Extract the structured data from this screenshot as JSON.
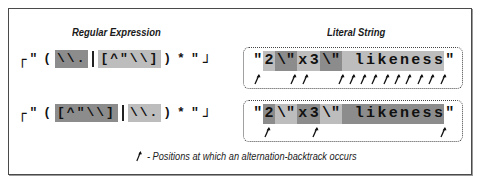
{
  "headings": {
    "regex": "Regular Expression",
    "literal": "Literal String"
  },
  "rows": [
    {
      "regex_tokens": [
        {
          "text": "\"",
          "shade": "none"
        },
        {
          "text": "(",
          "shade": "none"
        },
        {
          "text": "\\\\.",
          "shade": "dark"
        },
        {
          "text": "|",
          "shade": "sep"
        },
        {
          "text": "[^\"\\\\]",
          "shade": "light"
        },
        {
          "text": ")",
          "shade": "none"
        },
        {
          "text": "*",
          "shade": "none"
        },
        {
          "text": "\"",
          "shade": "none"
        }
      ],
      "literal_cells": [
        {
          "text": "\"",
          "shade": "none"
        },
        {
          "text": "2",
          "shade": "light"
        },
        {
          "text": "\\\"",
          "shade": "dark"
        },
        {
          "text": "x",
          "shade": "light"
        },
        {
          "text": "3",
          "shade": "light"
        },
        {
          "text": "\\\"",
          "shade": "dark"
        },
        {
          "text": " ",
          "shade": "light"
        },
        {
          "text": "l",
          "shade": "light"
        },
        {
          "text": "i",
          "shade": "light"
        },
        {
          "text": "k",
          "shade": "light"
        },
        {
          "text": "e",
          "shade": "light"
        },
        {
          "text": "n",
          "shade": "light"
        },
        {
          "text": "e",
          "shade": "light"
        },
        {
          "text": "s",
          "shade": "light"
        },
        {
          "text": "s",
          "shade": "light"
        },
        {
          "text": "\"",
          "shade": "none"
        }
      ],
      "arrow_positions": [
        258,
        294,
        306,
        342,
        353,
        364,
        375,
        387,
        398,
        409,
        421,
        432,
        444
      ]
    },
    {
      "regex_tokens": [
        {
          "text": "\"",
          "shade": "none"
        },
        {
          "text": "(",
          "shade": "none"
        },
        {
          "text": "[^\"\\\\]",
          "shade": "dark"
        },
        {
          "text": "|",
          "shade": "sep"
        },
        {
          "text": "\\\\.",
          "shade": "light"
        },
        {
          "text": ")",
          "shade": "none"
        },
        {
          "text": "*",
          "shade": "none"
        },
        {
          "text": "\"",
          "shade": "none"
        }
      ],
      "literal_cells": [
        {
          "text": "\"",
          "shade": "none"
        },
        {
          "text": "2",
          "shade": "dark"
        },
        {
          "text": "\\\"",
          "shade": "light"
        },
        {
          "text": "x",
          "shade": "dark"
        },
        {
          "text": "3",
          "shade": "dark"
        },
        {
          "text": "\\\"",
          "shade": "light"
        },
        {
          "text": " ",
          "shade": "dark"
        },
        {
          "text": "l",
          "shade": "dark"
        },
        {
          "text": "i",
          "shade": "dark"
        },
        {
          "text": "k",
          "shade": "dark"
        },
        {
          "text": "e",
          "shade": "dark"
        },
        {
          "text": "n",
          "shade": "dark"
        },
        {
          "text": "e",
          "shade": "dark"
        },
        {
          "text": "s",
          "shade": "dark"
        },
        {
          "text": "s",
          "shade": "dark"
        },
        {
          "text": "\"",
          "shade": "none"
        }
      ],
      "arrow_positions": [
        268,
        316,
        444
      ]
    }
  ],
  "legend": {
    "icon": "backtrack-arrow-icon",
    "text": "- Positions at which an alternation-backtrack occurs"
  },
  "colors": {
    "dark_shade": "#8c8c8c",
    "light_shade": "#bdbdbd",
    "border": "#4a4a4a"
  }
}
